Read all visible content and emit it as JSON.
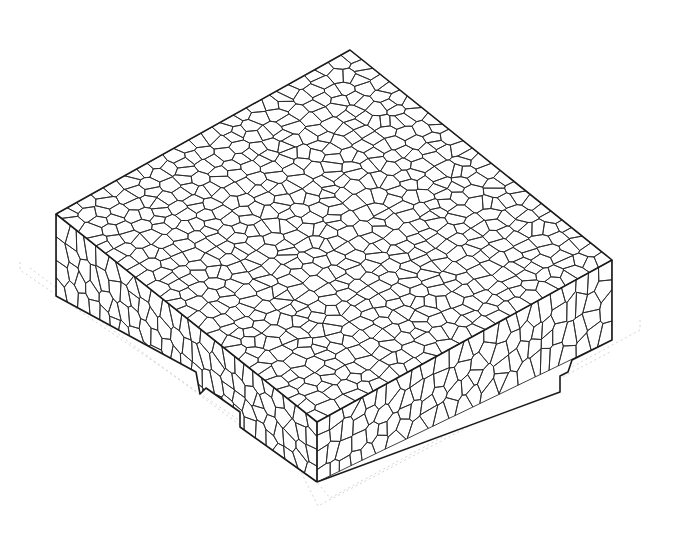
{
  "diagram": {
    "faces": [
      "top",
      "left-front",
      "right-front"
    ],
    "features": [
      "voronoi-grain-mesh",
      "step-notch-left-face",
      "step-notch-right-face",
      "faint-offset-shadow-outline"
    ],
    "colors": {
      "background": "#ffffff",
      "grain_boundary": "#2a2a2a",
      "outer_edge": "#1a1a1a",
      "shadow_outline": "#d4d4d4"
    },
    "approx_grain_count_top_face": 700,
    "labels": []
  }
}
